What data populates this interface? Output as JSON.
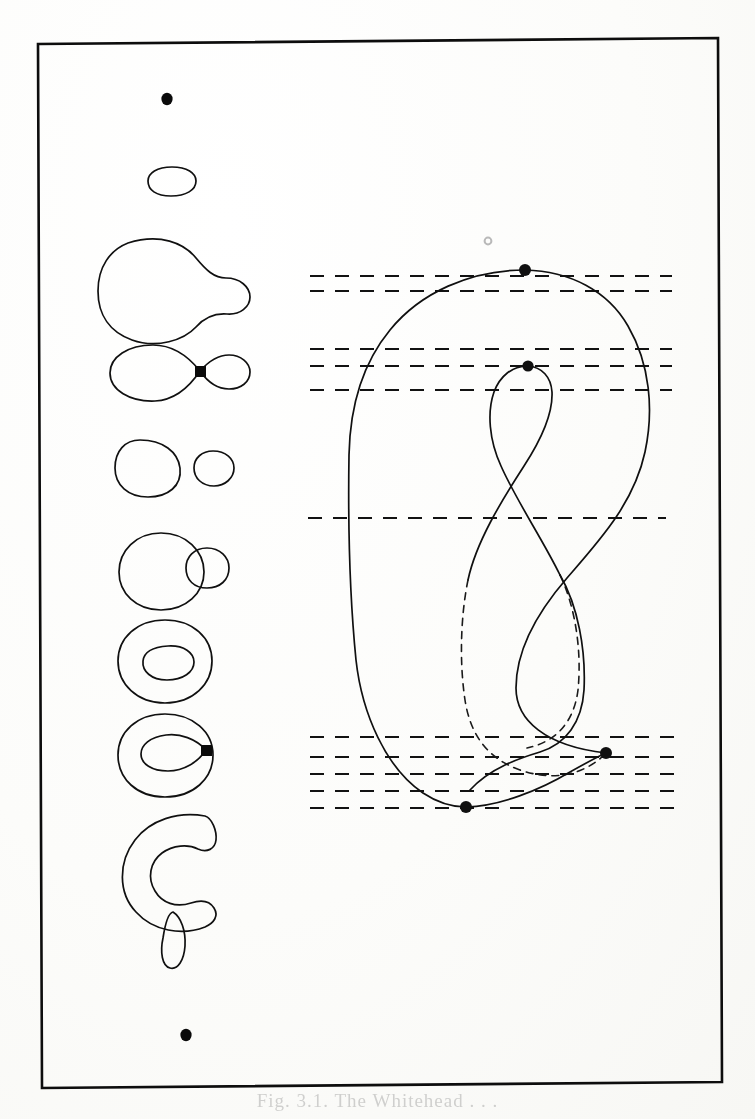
{
  "figure": {
    "kind": "mathematical-line-diagram",
    "background_color": "#fbfbf9",
    "ink_color": "#101010",
    "frame": {
      "label": "figure-border",
      "stroke": "#0d0d0d",
      "stroke_width": 2.6,
      "corners": [
        [
          38,
          44
        ],
        [
          718,
          38
        ],
        [
          722,
          1082
        ],
        [
          42,
          1088
        ]
      ]
    },
    "left_column": {
      "label": "level-set-sequence",
      "items": [
        {
          "name": "point-top",
          "type": "dot",
          "cx": 167,
          "cy": 99,
          "r": 5.2
        },
        {
          "name": "small-ellipse",
          "type": "closed-curve",
          "cx": 172,
          "cy": 181,
          "rx": 24,
          "ry": 14
        },
        {
          "name": "pear-shape",
          "type": "closed-curve",
          "cx": 168,
          "cy": 272
        },
        {
          "name": "figure-eight-upper",
          "type": "closed-curve-with-node",
          "cx": 168,
          "cy": 371,
          "node": {
            "x": 200,
            "y": 371
          }
        },
        {
          "name": "two-ovals",
          "type": "closed-curve-pair",
          "cx": 166,
          "cy": 466
        },
        {
          "name": "circle-with-bud",
          "type": "closed-curve-pair",
          "cx": 166,
          "cy": 566
        },
        {
          "name": "annulus",
          "type": "nested-closed-curves",
          "cx": 167,
          "cy": 660
        },
        {
          "name": "figure-eight-lower",
          "type": "closed-curve-with-node",
          "cx": 167,
          "cy": 756,
          "node": {
            "x": 206,
            "y": 750
          }
        },
        {
          "name": "crescent-c-shape",
          "type": "closed-curve",
          "cx": 168,
          "cy": 852
        },
        {
          "name": "thin-arc",
          "type": "closed-curve",
          "cx": 174,
          "cy": 934
        },
        {
          "name": "point-bottom",
          "type": "dot",
          "cx": 186,
          "cy": 1035,
          "r": 5.2
        }
      ]
    },
    "right_panel": {
      "label": "curve-with-level-lines",
      "curve": {
        "name": "s-shaped-closed-curve",
        "stroke": "#101010",
        "stroke_width": 1.7,
        "hidden_segments_style": "dashed"
      },
      "critical_points": [
        {
          "name": "critical-point-maximum",
          "x": 525,
          "y": 270,
          "r": 6.0,
          "type": "maximum"
        },
        {
          "name": "critical-point-saddle-upper",
          "x": 528,
          "y": 366,
          "r": 5.6,
          "type": "saddle"
        },
        {
          "name": "critical-point-saddle-lower",
          "x": 606,
          "y": 753,
          "r": 6.0,
          "type": "saddle"
        },
        {
          "name": "critical-point-minimum",
          "x": 466,
          "y": 807,
          "r": 6.0,
          "type": "minimum"
        }
      ],
      "faint_marker": {
        "name": "faint-grey-dot",
        "x": 488,
        "y": 241,
        "r": 3.4,
        "color": "#b9b9b9"
      },
      "level_lines": {
        "stroke": "#121212",
        "stroke_width": 1.9,
        "dash": "14 11",
        "groups": [
          {
            "name": "level-group-top",
            "y_values": [
              276,
              291
            ],
            "x_start": 310,
            "x_end": 672
          },
          {
            "name": "level-group-upper-middle",
            "y_values": [
              349,
              366,
              390
            ],
            "x_start": 310,
            "x_end": 672
          },
          {
            "name": "level-group-center",
            "y_values": [
              518
            ],
            "x_start": 308,
            "x_end": 666
          },
          {
            "name": "level-group-bottom",
            "y_values": [
              737,
              757,
              774,
              791,
              808
            ],
            "x_start": 310,
            "x_end": 678
          }
        ]
      }
    },
    "bleed_through_text": "Fig. 3.1. The Whitehead . . ."
  }
}
